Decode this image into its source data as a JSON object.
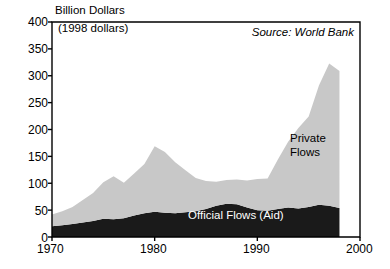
{
  "chart_data": {
    "type": "area",
    "stacked": true,
    "title": "Billion Dollars",
    "subtitle": "(1998 dollars)",
    "source_note": "Source: World Bank",
    "xlabel": "",
    "ylabel": "Billion Dollars",
    "ylim": [
      0,
      400
    ],
    "xlim": [
      1970,
      2000
    ],
    "grid": false,
    "legend_position": "inline-annotations",
    "ytick_labels": [
      "400",
      "350",
      "300",
      "250",
      "200",
      "150",
      "100",
      "50",
      "0"
    ],
    "ytick_values": [
      400,
      350,
      300,
      250,
      200,
      150,
      100,
      50,
      0
    ],
    "xtick_labels": [
      "1970",
      "1980",
      "1990",
      "2000"
    ],
    "xtick_values": [
      1970,
      1980,
      1990,
      2000
    ],
    "x": [
      1970,
      1971,
      1972,
      1973,
      1974,
      1975,
      1976,
      1977,
      1978,
      1979,
      1980,
      1981,
      1982,
      1983,
      1984,
      1985,
      1986,
      1987,
      1988,
      1989,
      1990,
      1991,
      1992,
      1993,
      1994,
      1995,
      1996,
      1997,
      1998
    ],
    "series": [
      {
        "name": "Official Flows (Aid)",
        "color": "#1a1a1a",
        "values": [
          20,
          22,
          24,
          27,
          30,
          34,
          33,
          35,
          40,
          44,
          47,
          45,
          44,
          46,
          48,
          52,
          58,
          62,
          61,
          55,
          50,
          49,
          52,
          55,
          53,
          56,
          60,
          58,
          54
        ]
      },
      {
        "name": "Private Flows",
        "color": "#c8c8c8",
        "values": [
          22,
          26,
          32,
          42,
          52,
          68,
          80,
          66,
          78,
          92,
          122,
          113,
          95,
          78,
          62,
          52,
          45,
          44,
          46,
          50,
          58,
          60,
          92,
          122,
          150,
          168,
          222,
          265,
          255
        ]
      }
    ],
    "totals": [
      42,
      48,
      56,
      69,
      82,
      102,
      113,
      101,
      118,
      136,
      169,
      158,
      139,
      124,
      110,
      104,
      103,
      106,
      107,
      105,
      108,
      109,
      144,
      177,
      203,
      224,
      282,
      323,
      309
    ],
    "annotations": [
      {
        "text": "Private\nFlows",
        "series": "Private Flows"
      },
      {
        "text": "Official Flows (Aid)",
        "series": "Official Flows (Aid)"
      }
    ]
  },
  "labels": {
    "axis_title": "Billion Dollars",
    "axis_subtitle": "(1998 dollars)",
    "source": "Source: World Bank",
    "private_line1": "Private",
    "private_line2": "Flows",
    "official": "Official Flows (Aid)",
    "y": [
      "400",
      "350",
      "300",
      "250",
      "200",
      "150",
      "100",
      "50",
      "0"
    ],
    "x": [
      "1970",
      "1980",
      "1990",
      "2000"
    ]
  }
}
